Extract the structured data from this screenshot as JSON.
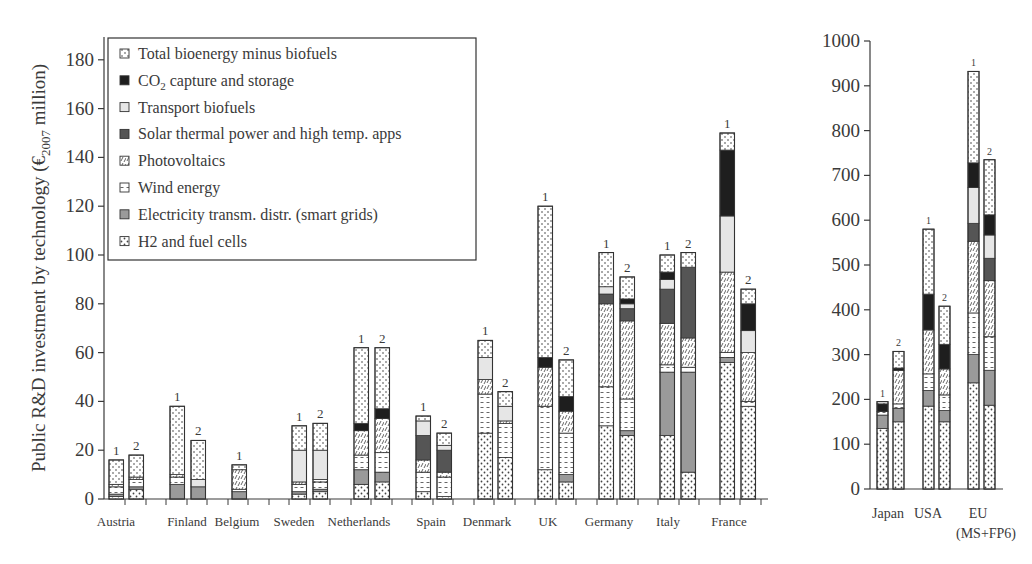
{
  "chart_data": [
    {
      "type": "bar",
      "stacked": true,
      "title": "",
      "ylabel": "Public R&D investment by technology (€2007 million)",
      "ylabel_main": "Public R&D investment by technology (€",
      "ylabel_sub": "2007",
      "ylabel_end": " million)",
      "xlabel": "",
      "ylim": [
        0,
        190
      ],
      "yticks": [
        0,
        20,
        40,
        60,
        80,
        100,
        120,
        140,
        160,
        180
      ],
      "grid": false,
      "legend_position": "upper-left",
      "legend": [
        {
          "key": "bio",
          "label": "Total bioenergy minus biofuels",
          "pattern": "dotted-vertical"
        },
        {
          "key": "ccs",
          "label_main": "CO",
          "label_sub": "2",
          "label_end": " capture and storage",
          "label": "CO2 capture and storage",
          "pattern": "solid-black"
        },
        {
          "key": "tb",
          "label": "Transport biofuels",
          "pattern": "light-gray"
        },
        {
          "key": "st",
          "label": "Solar thermal power and high temp. apps",
          "pattern": "dark-gray"
        },
        {
          "key": "pv",
          "label": "Photovoltaics",
          "pattern": "diagonal-hatch"
        },
        {
          "key": "wind",
          "label": "Wind energy",
          "pattern": "dashed-horizontal"
        },
        {
          "key": "grid",
          "label": "Electricity transm. distr. (smart grids)",
          "pattern": "medium-gray"
        },
        {
          "key": "h2",
          "label": "H2 and fuel cells",
          "pattern": "dots"
        }
      ],
      "series_order_bottom_to_top": [
        "h2",
        "grid",
        "wind",
        "pv",
        "st",
        "tb",
        "ccs",
        "bio"
      ],
      "categories": [
        "Austria",
        "Finland",
        "Belgium",
        "Sweden",
        "Netherlands",
        "Spain",
        "Denmark",
        "UK",
        "Germany",
        "Italy",
        "France"
      ],
      "bars": [
        {
          "country": "Austria",
          "label": "1",
          "total": 16,
          "h2": 1,
          "grid": 1,
          "wind": 3,
          "pv": 1,
          "st": 0,
          "tb": 0,
          "ccs": 0,
          "bio": 10
        },
        {
          "country": "Austria",
          "label": "2",
          "total": 18,
          "h2": 4,
          "grid": 1,
          "wind": 3,
          "pv": 1,
          "st": 0,
          "tb": 0,
          "ccs": 0,
          "bio": 9
        },
        {
          "country": "Finland",
          "label": "1",
          "total": 38,
          "h2": 0,
          "grid": 6,
          "wind": 3,
          "pv": 1,
          "st": 0,
          "tb": 0,
          "ccs": 0,
          "bio": 28
        },
        {
          "country": "Finland",
          "label": "2",
          "total": 24,
          "h2": 0,
          "grid": 5,
          "wind": 0,
          "pv": 0,
          "st": 0,
          "tb": 3,
          "ccs": 0,
          "bio": 16
        },
        {
          "country": "Belgium",
          "label": "1",
          "total": 14,
          "h2": 0,
          "grid": 3,
          "wind": 1,
          "pv": 8,
          "st": 0,
          "tb": 0,
          "ccs": 0,
          "bio": 2
        },
        {
          "country": "Sweden",
          "label": "1",
          "total": 30,
          "h2": 2,
          "grid": 1,
          "wind": 3,
          "pv": 1,
          "st": 0,
          "tb": 13,
          "ccs": 0,
          "bio": 10
        },
        {
          "country": "Sweden",
          "label": "2",
          "total": 31,
          "h2": 3,
          "grid": 1,
          "wind": 3,
          "pv": 1,
          "st": 0,
          "tb": 12,
          "ccs": 0,
          "bio": 11
        },
        {
          "country": "Netherlands",
          "label": "1",
          "total": 62,
          "h2": 6,
          "grid": 6,
          "wind": 6,
          "pv": 10,
          "st": 0,
          "tb": 0,
          "ccs": 3,
          "bio": 31
        },
        {
          "country": "Netherlands",
          "label": "2",
          "total": 62,
          "h2": 7,
          "grid": 4,
          "wind": 8,
          "pv": 14,
          "st": 0,
          "tb": 0,
          "ccs": 4,
          "bio": 25
        },
        {
          "country": "Spain",
          "label": "1",
          "total": 34,
          "h2": 3,
          "grid": 0,
          "wind": 8,
          "pv": 5,
          "st": 10,
          "tb": 6,
          "ccs": 0,
          "bio": 2
        },
        {
          "country": "Spain",
          "label": "2",
          "total": 27,
          "h2": 1,
          "grid": 0,
          "wind": 8,
          "pv": 2,
          "st": 9,
          "tb": 2,
          "ccs": 0,
          "bio": 5
        },
        {
          "country": "Denmark",
          "label": "1",
          "total": 65,
          "h2": 27,
          "grid": 0,
          "wind": 16,
          "pv": 6,
          "st": 0,
          "tb": 9,
          "ccs": 0,
          "bio": 7
        },
        {
          "country": "Denmark",
          "label": "2",
          "total": 44,
          "h2": 17,
          "grid": 0,
          "wind": 14,
          "pv": 1,
          "st": 0,
          "tb": 6,
          "ccs": 0,
          "bio": 6
        },
        {
          "country": "UK",
          "label": "1",
          "total": 120,
          "h2": 12,
          "grid": 0,
          "wind": 26,
          "pv": 16,
          "st": 0,
          "tb": 0,
          "ccs": 4,
          "bio": 62
        },
        {
          "country": "UK",
          "label": "2",
          "total": 57,
          "h2": 7,
          "grid": 3,
          "wind": 17,
          "pv": 9,
          "st": 0,
          "tb": 0,
          "ccs": 6,
          "bio": 15
        },
        {
          "country": "Germany",
          "label": "1",
          "total": 101,
          "h2": 30,
          "grid": 0,
          "wind": 16,
          "pv": 34,
          "st": 4,
          "tb": 3,
          "ccs": 0,
          "bio": 14
        },
        {
          "country": "Germany",
          "label": "2",
          "total": 91,
          "h2": 26,
          "grid": 2,
          "wind": 13,
          "pv": 32,
          "st": 5,
          "tb": 2,
          "ccs": 2,
          "bio": 9
        },
        {
          "country": "Italy",
          "label": "1",
          "total": 100,
          "h2": 26,
          "grid": 26,
          "wind": 3,
          "pv": 17,
          "st": 14,
          "tb": 4,
          "ccs": 3,
          "bio": 7
        },
        {
          "country": "Italy",
          "label": "2",
          "total": 101,
          "h2": 11,
          "grid": 41,
          "wind": 2,
          "pv": 12,
          "st": 29,
          "tb": 0,
          "ccs": 0,
          "bio": 6
        },
        {
          "country": "France",
          "label": "1",
          "total": 150,
          "h2": 56,
          "grid": 2,
          "wind": 2,
          "pv": 33,
          "st": 0,
          "tb": 23,
          "ccs": 27,
          "bio": 7
        },
        {
          "country": "France",
          "label": "2",
          "total": 86,
          "h2": 38,
          "grid": 0,
          "wind": 2,
          "pv": 20,
          "st": 0,
          "tb": 9,
          "ccs": 11,
          "bio": 6
        }
      ]
    },
    {
      "type": "bar",
      "stacked": true,
      "title": "",
      "ylabel": "",
      "xlabel": "",
      "ylim": [
        0,
        1000
      ],
      "yticks": [
        0,
        100,
        200,
        300,
        400,
        500,
        600,
        700,
        800,
        900,
        1000
      ],
      "grid": false,
      "categories": [
        "Japan",
        "USA",
        "EU"
      ],
      "category_sublabels": [
        "",
        "",
        "(MS+FP6)"
      ],
      "series_order_bottom_to_top": [
        "h2",
        "grid",
        "wind",
        "pv",
        "st",
        "tb",
        "ccs",
        "bio"
      ],
      "bars": [
        {
          "country": "Japan",
          "label": "1",
          "total": 195,
          "h2": 135,
          "grid": 30,
          "wind": 8,
          "pv": 0,
          "st": 0,
          "tb": 0,
          "ccs": 17,
          "bio": 5
        },
        {
          "country": "Japan",
          "label": "2",
          "total": 307,
          "h2": 150,
          "grid": 30,
          "wind": 10,
          "pv": 75,
          "st": 0,
          "tb": 0,
          "ccs": 5,
          "bio": 37
        },
        {
          "country": "USA",
          "label": "1",
          "total": 580,
          "h2": 185,
          "grid": 35,
          "wind": 37,
          "pv": 98,
          "st": 0,
          "tb": 0,
          "ccs": 80,
          "bio": 145
        },
        {
          "country": "USA",
          "label": "2",
          "total": 408,
          "h2": 150,
          "grid": 25,
          "wind": 35,
          "pv": 58,
          "st": 0,
          "tb": 0,
          "ccs": 55,
          "bio": 85
        },
        {
          "country": "EU",
          "label": "1",
          "total": 932,
          "h2": 237,
          "grid": 63,
          "wind": 93,
          "pv": 160,
          "st": 40,
          "tb": 80,
          "ccs": 55,
          "bio": 204
        },
        {
          "country": "EU",
          "label": "2",
          "total": 735,
          "h2": 187,
          "grid": 78,
          "wind": 75,
          "pv": 125,
          "st": 50,
          "tb": 52,
          "ccs": 45,
          "bio": 123
        }
      ]
    }
  ],
  "colors": {
    "axis": "#3a3a3a",
    "ccs": "#1e1e1e",
    "st": "#555555",
    "grid": "#9a9a9a",
    "tb": "#e6e6e6",
    "background": "#ffffff"
  }
}
